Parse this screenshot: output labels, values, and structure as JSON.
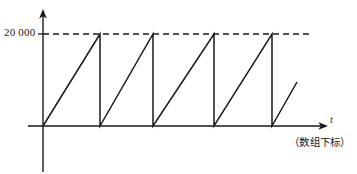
{
  "figure": {
    "title": "",
    "background_color": "#ffffff",
    "stroke_color": "#1a1a1a",
    "threshold_label": "20 000",
    "x_axis_label": "t",
    "axis_caption": "（数组下标）"
  },
  "chart_data": {
    "type": "line",
    "title": "",
    "xlabel": "t",
    "ylabel": "",
    "annotations": [
      "20 000",
      "（数组下标）"
    ],
    "grid": false,
    "legend": null,
    "axis_style": {
      "x_axis_arrow": true,
      "y_axis_arrow": true,
      "x_axis_y_pixel": 126,
      "y_axis_x_pixel": 43,
      "y_axis_extends_below_origin": true
    },
    "threshold": {
      "label": "20 000",
      "value": 20000,
      "style": "dashed",
      "y_pixel": 34,
      "x_start_pixel": 43,
      "x_end_pixel": 310
    },
    "ylim": [
      0,
      23000
    ],
    "peak_value": 20000,
    "reset_value": 0,
    "cycles_complete": 4,
    "cycles_partial": 1,
    "series": [
      {
        "name": "counter",
        "points_pixel": [
          [
            43,
            126
          ],
          [
            100,
            34
          ],
          [
            100,
            126
          ],
          [
            153,
            34
          ],
          [
            153,
            126
          ],
          [
            214,
            34
          ],
          [
            214,
            126
          ],
          [
            272,
            34
          ],
          [
            272,
            126
          ],
          [
            297,
            82
          ]
        ],
        "values": [
          {
            "x": 0,
            "y": 0
          },
          {
            "x": 1,
            "y": 20000
          },
          {
            "x": 1,
            "y": 0
          },
          {
            "x": 2,
            "y": 20000
          },
          {
            "x": 2,
            "y": 0
          },
          {
            "x": 3,
            "y": 20000
          },
          {
            "x": 3,
            "y": 0
          },
          {
            "x": 4,
            "y": 20000
          },
          {
            "x": 4,
            "y": 0
          },
          {
            "x": 4.43,
            "y": 9600
          }
        ]
      }
    ],
    "reset_x_pixels": [
      100,
      153,
      214,
      272
    ],
    "peak_x_pixels": [
      100,
      153,
      214,
      272
    ]
  }
}
